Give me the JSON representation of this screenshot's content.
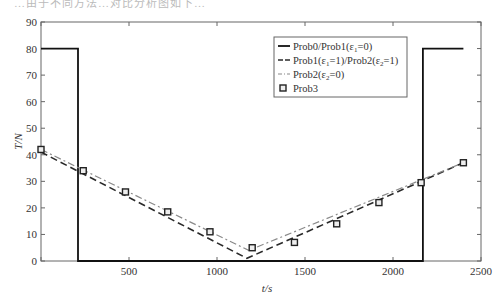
{
  "page": {
    "top_fragment_text": "…由于不同方法…对比分析图如下…"
  },
  "chart_data": {
    "type": "line",
    "title": "",
    "xlabel": "t/s",
    "ylabel": "T/N",
    "xlim": [
      0,
      2500
    ],
    "ylim": [
      0,
      90
    ],
    "xticks": [
      500,
      1000,
      1500,
      2000,
      2500
    ],
    "yticks": [
      0,
      10,
      20,
      30,
      40,
      50,
      60,
      70,
      80,
      90
    ],
    "grid": false,
    "legend_position": "upper right (inside, left of right step)",
    "series": [
      {
        "name": "Prob0/Prob1(ε1=0)",
        "style": "solid",
        "color": "#111111",
        "x": [
          0,
          210,
          210,
          2170,
          2170,
          2400
        ],
        "y": [
          80,
          80,
          0,
          0,
          80,
          80
        ]
      },
      {
        "name": "Prob1(ε1=1)/Prob2(ε2=1)",
        "style": "dashed",
        "color": "#2a2a2a",
        "x": [
          0,
          1170,
          2400
        ],
        "y": [
          41,
          1,
          37
        ]
      },
      {
        "name": "Prob2(ε2=0)",
        "style": "dash-dot",
        "color": "#8a8a8a",
        "x": [
          0,
          1180,
          2400
        ],
        "y": [
          42,
          4,
          37
        ]
      },
      {
        "name": "Prob3",
        "style": "square-markers",
        "color": "#222222",
        "x": [
          0,
          240,
          480,
          720,
          960,
          1200,
          1440,
          1680,
          1920,
          2160,
          2400
        ],
        "y": [
          42,
          34,
          26,
          18.5,
          11,
          5,
          7,
          14,
          22,
          29.5,
          37
        ]
      }
    ]
  },
  "legend": {
    "items": [
      {
        "label": "Prob0/Prob1(ε",
        "sub": "1",
        "tail": "=0)"
      },
      {
        "label": "Prob1(ε",
        "sub": "1",
        "mid": "=1)/Prob2(ε",
        "sub2": "2",
        "tail": "=1)"
      },
      {
        "label": "Prob2(ε",
        "sub": "2",
        "tail": "=0)"
      },
      {
        "label": "Prob3"
      }
    ]
  }
}
